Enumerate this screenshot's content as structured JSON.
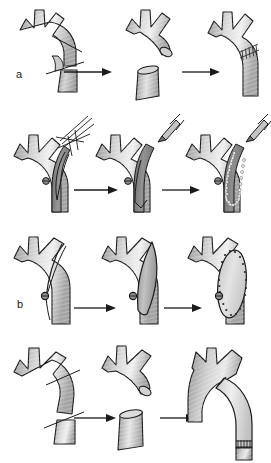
{
  "figure": {
    "kind": "medical-illustration",
    "panel_count": 12,
    "row_count": 4,
    "stage_count_per_row": 3,
    "background_color": "#ffffff",
    "line_color": "#1a1a1a",
    "vessel_fill_light": "#e8e8e8",
    "vessel_fill_mid": "#b8b8b8",
    "vessel_fill_dark": "#8a8a8a",
    "graft_fill": "#d8d8d8",
    "arrow_color": "#1a1a1a"
  },
  "rows": [
    {
      "label": "a",
      "name": "row-a-resection-and-interposition",
      "stages": [
        {
          "name": "aortic-arch-with-transection-lines",
          "caption": ""
        },
        {
          "name": "arch-remnant-and-excised-segment",
          "caption": ""
        },
        {
          "name": "reanastomosed-arch-with-suture-line",
          "caption": ""
        }
      ],
      "arrows": [
        {
          "name": "arrow-a-1"
        },
        {
          "name": "arrow-a-2"
        }
      ]
    },
    {
      "label": "b",
      "name": "row-b-patch-with-clamp-and-suture",
      "stages": [
        {
          "name": "arch-with-suture-needle-bundle",
          "caption": ""
        },
        {
          "name": "arch-with-patch-and-instrument",
          "caption": ""
        },
        {
          "name": "arch-with-sutured-patch-and-instrument",
          "caption": ""
        }
      ],
      "arrows": [
        {
          "name": "arrow-b-1"
        },
        {
          "name": "arrow-b-2"
        }
      ]
    },
    {
      "label": "c",
      "name": "row-c-longitudinal-patch-repair",
      "stages": [
        {
          "name": "arch-with-incision-line-and-clip",
          "caption": ""
        },
        {
          "name": "arch-with-opened-lens-defect",
          "caption": ""
        },
        {
          "name": "arch-with-sutured-oval-patch",
          "caption": ""
        }
      ],
      "arrows": [
        {
          "name": "arrow-c-1"
        },
        {
          "name": "arrow-c-2"
        }
      ]
    },
    {
      "label": "d",
      "name": "row-d-graft-bypass-replacement",
      "stages": [
        {
          "name": "arch-with-two-transection-lines",
          "caption": ""
        },
        {
          "name": "arch-remnant-and-resected-tube",
          "caption": ""
        },
        {
          "name": "arch-with-interposed-tube-graft",
          "caption": ""
        }
      ],
      "arrows": [
        {
          "name": "arrow-d-1"
        },
        {
          "name": "arrow-d-2"
        }
      ]
    }
  ]
}
